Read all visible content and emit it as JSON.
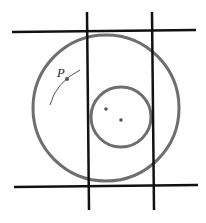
{
  "diagram": {
    "labels": {
      "point_p": "P"
    },
    "colors": {
      "lines": "#111111",
      "circles": "#6e6e6e",
      "points": "#555555",
      "background": "#ffffff"
    },
    "elements": {
      "horizontal_lines": 2,
      "vertical_lines": 2,
      "circles": 2,
      "points": 3,
      "arc": 1
    }
  }
}
